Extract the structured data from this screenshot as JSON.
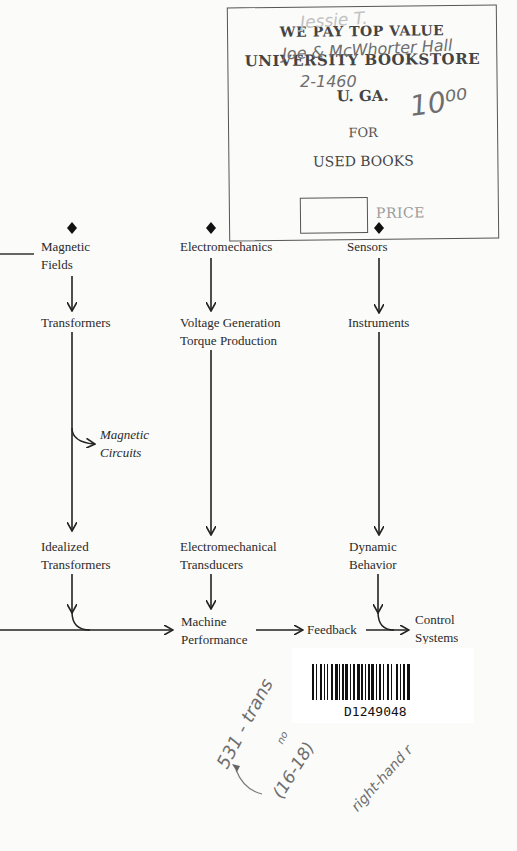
{
  "stamp": {
    "line1": "WE PAY TOP VALUE",
    "line2": "UNIVERSITY BOOKSTORE",
    "line3": "U. GA.",
    "line4": "FOR",
    "line5": "USED BOOKS",
    "price_label": "PRICE"
  },
  "handwriting": {
    "top_faint": "Jessie T.",
    "address": "Joe & McWhorter Hall",
    "phone": "2-1460",
    "price": "10⁰⁰",
    "margin_note": "531 - trans",
    "margin_sub": "no",
    "pages": "(16-18)",
    "right_note": "right-hand r"
  },
  "diagram": {
    "columns": [
      {
        "top": [
          "Magnetic",
          "Fields"
        ],
        "mid": [
          "Transformers"
        ],
        "side_note": [
          "Magnetic",
          "Circuits"
        ],
        "bottom": [
          "Idealized",
          "Transformers"
        ]
      },
      {
        "top": [
          "Electromechanics"
        ],
        "mid": [
          "Voltage Generation",
          "Torque Production"
        ],
        "bottom": [
          "Electromechanical",
          "Transducers"
        ],
        "result": [
          "Machine",
          "Performance"
        ]
      },
      {
        "top": [
          "Sensors"
        ],
        "mid": [
          "Instruments"
        ],
        "bottom": [
          "Dynamic",
          "Behavior"
        ]
      }
    ],
    "feedback": "Feedback",
    "control": [
      "Control",
      "Systems"
    ]
  },
  "barcode": {
    "number": "D1249048"
  },
  "colors": {
    "ink": "#222222",
    "stamp": "#555555",
    "pencil": "#6e6e6e",
    "paper": "#fbfbfa"
  }
}
